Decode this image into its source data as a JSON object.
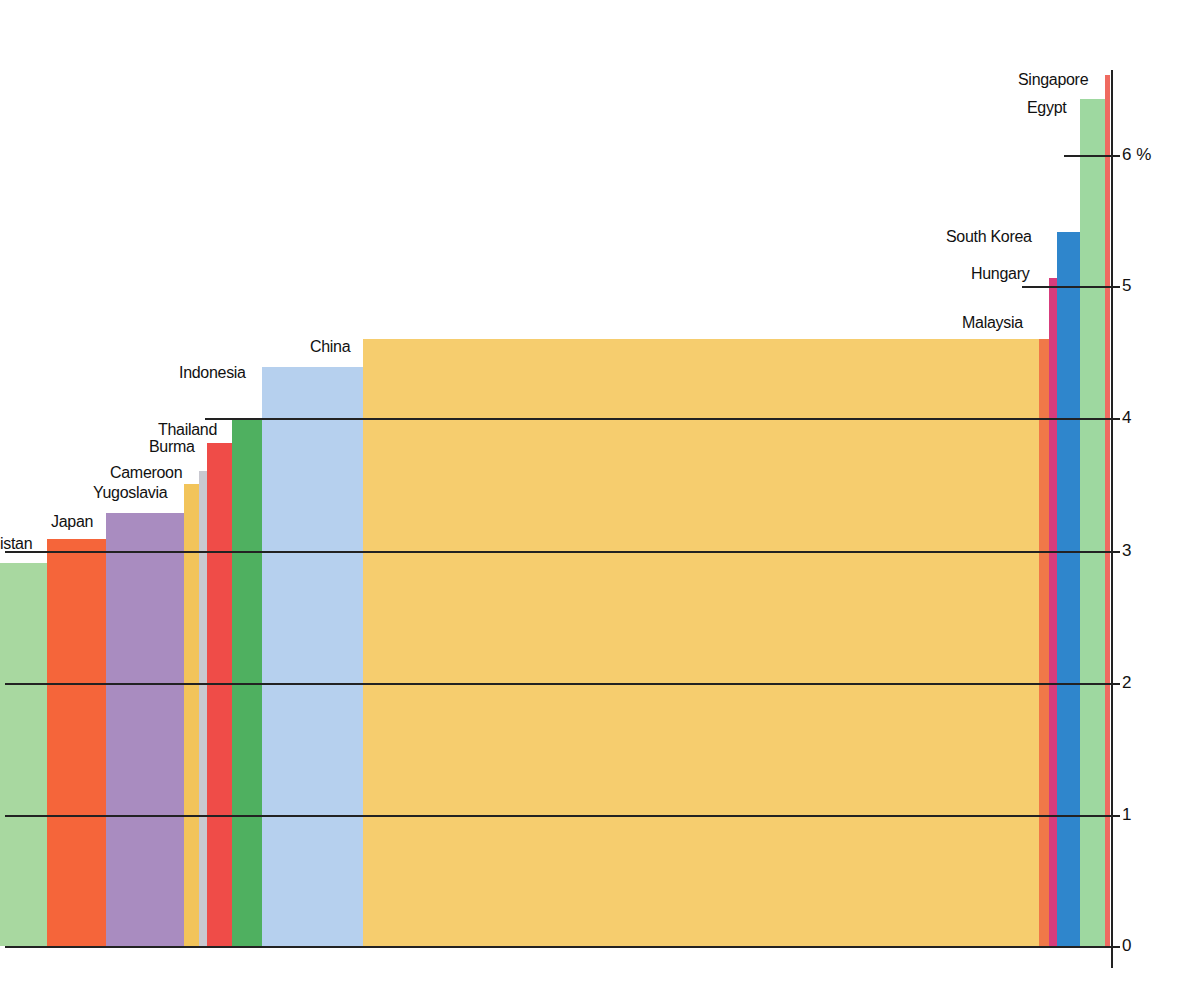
{
  "chart_data": {
    "type": "bar",
    "subtype": "variable-width bar (width proportional to population)",
    "title": "",
    "xlabel": "",
    "ylabel": "%",
    "ylim": [
      0,
      6.6
    ],
    "y_ticks": [
      "0",
      "1",
      "2",
      "3",
      "4",
      "5",
      "6 %"
    ],
    "grid": true,
    "categories": [
      "Pakistan",
      "Japan",
      "(unlabeled)",
      "Yugoslavia",
      "Cameroon",
      "Burma",
      "Thailand",
      "Indonesia",
      "China",
      "Malaysia",
      "Hungary",
      "South Korea",
      "Egypt",
      "Singapore"
    ],
    "values": [
      2.9,
      3.1,
      3.3,
      3.5,
      3.6,
      3.8,
      4.0,
      4.4,
      4.6,
      4.6,
      5.1,
      5.4,
      6.4,
      6.6
    ],
    "colors": [
      "#a8d8a0",
      "#f5653a",
      "#a98cc0",
      "#f2c45a",
      "#c8c8d0",
      "#ef4c48",
      "#4fb060",
      "#b6d0ee",
      "#f6cd6e",
      "#f07848",
      "#d83c7c",
      "#2f86cc",
      "#9ed8a0",
      "#ef6a60"
    ]
  },
  "bars": [
    {
      "label": "istan",
      "x": 0,
      "w": 47,
      "top": 563,
      "color": "#a8d8a0"
    },
    {
      "label": "Japan",
      "x": 47,
      "w": 59,
      "top": 539,
      "color": "#f5653a"
    },
    {
      "label": "",
      "x": 106,
      "w": 78,
      "top": 513,
      "color": "#a98cc0"
    },
    {
      "label": "Yugoslavia",
      "x": 184,
      "w": 15,
      "top": 484,
      "color": "#f2c45a"
    },
    {
      "label": "Cameroon",
      "x": 199,
      "w": 8,
      "top": 471,
      "color": "#c8c8d0"
    },
    {
      "label": "Burma",
      "x": 207,
      "w": 25,
      "top": 443,
      "color": "#ef4c48"
    },
    {
      "label": "Thailand",
      "x": 232,
      "w": 30,
      "top": 420,
      "color": "#4fb060"
    },
    {
      "label": "Indonesia",
      "x": 262,
      "w": 101,
      "top": 367,
      "color": "#b6d0ee"
    },
    {
      "label": "China",
      "x": 363,
      "w": 676,
      "top": 339,
      "color": "#f6cd6e"
    },
    {
      "label": "Malaysia",
      "x": 1039,
      "w": 10,
      "top": 339,
      "color": "#f07848"
    },
    {
      "label": "Hungary",
      "x": 1049,
      "w": 8,
      "top": 278,
      "color": "#d83c7c"
    },
    {
      "label": "South Korea",
      "x": 1057,
      "w": 23,
      "top": 232,
      "color": "#2f86cc"
    },
    {
      "label": "Egypt",
      "x": 1080,
      "w": 25,
      "top": 99,
      "color": "#9ed8a0"
    },
    {
      "label": "Singapore",
      "x": 1105,
      "w": 5,
      "top": 75,
      "color": "#ef6a60"
    }
  ],
  "labels": [
    {
      "text": "istan",
      "x": 0,
      "y": 535
    },
    {
      "text": "Japan",
      "x": 51,
      "y": 513
    },
    {
      "text": "Yugoslavia",
      "x": 93,
      "y": 484
    },
    {
      "text": "Cameroon",
      "x": 110,
      "y": 464
    },
    {
      "text": "Burma",
      "x": 149,
      "y": 438
    },
    {
      "text": "Thailand",
      "x": 158,
      "y": 421
    },
    {
      "text": "Indonesia",
      "x": 179,
      "y": 364
    },
    {
      "text": "China",
      "x": 310,
      "y": 338
    },
    {
      "text": "Malaysia",
      "x": 962,
      "y": 314
    },
    {
      "text": "Hungary",
      "x": 971,
      "y": 265
    },
    {
      "text": "South Korea",
      "x": 946,
      "y": 228
    },
    {
      "text": "Egypt",
      "x": 1027,
      "y": 99
    },
    {
      "text": "Singapore",
      "x": 1018,
      "y": 71
    }
  ],
  "gridlines": [
    {
      "y": 946,
      "x1": 5,
      "x2": 1112,
      "tick": "0"
    },
    {
      "y": 815,
      "x1": 5,
      "x2": 1112,
      "tick": "1"
    },
    {
      "y": 683,
      "x1": 5,
      "x2": 1112,
      "tick": "2"
    },
    {
      "y": 551,
      "x1": 5,
      "x2": 1112,
      "tick": "3"
    },
    {
      "y": 418,
      "x1": 205,
      "x2": 1112,
      "tick": "4"
    },
    {
      "y": 286,
      "x1": 1022,
      "x2": 1112,
      "tick": "5"
    },
    {
      "y": 155,
      "x1": 1064,
      "x2": 1112,
      "tick": "6 %"
    }
  ]
}
